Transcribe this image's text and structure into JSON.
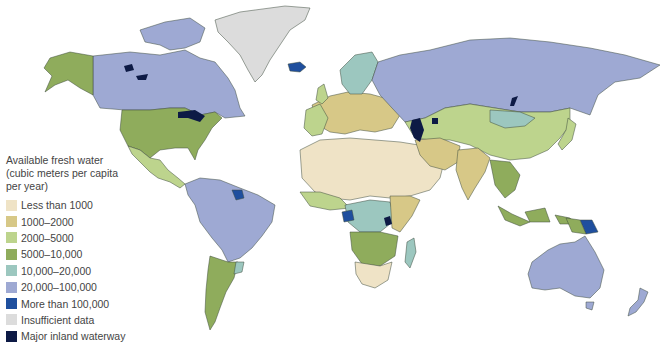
{
  "legend": {
    "title_lines": [
      "Available fresh water",
      "(cubic meters per capita",
      "per year)"
    ],
    "items": [
      {
        "label": "Less than 1000",
        "color": "#efe3c6"
      },
      {
        "label": "1000–2000",
        "color": "#d7c887"
      },
      {
        "label": "2000–5000",
        "color": "#bdd48d"
      },
      {
        "label": "5000–10,000",
        "color": "#8fac5c"
      },
      {
        "label": "10,000–20,000",
        "color": "#9cc7bf"
      },
      {
        "label": "20,000–100,000",
        "color": "#9ea9d3"
      },
      {
        "label": "More than 100,000",
        "color": "#1f4f9e"
      },
      {
        "label": "Insufficient data",
        "color": "#dcdcdc"
      },
      {
        "label": "Major inland waterway",
        "color": "#0d1a45"
      }
    ]
  },
  "map": {
    "type": "world choropleth",
    "metric": "Available fresh water per capita per year",
    "regions": [
      {
        "name": "Canada",
        "category": "20,000–100,000"
      },
      {
        "name": "Alaska",
        "category": "5000–10,000"
      },
      {
        "name": "United States",
        "category": "5000–10,000"
      },
      {
        "name": "Mexico",
        "category": "2000–5000"
      },
      {
        "name": "Greenland",
        "category": "Insufficient data"
      },
      {
        "name": "Iceland",
        "category": "More than 100,000"
      },
      {
        "name": "South America (north)",
        "category": "20,000–100,000"
      },
      {
        "name": "Guyana/Suriname",
        "category": "More than 100,000"
      },
      {
        "name": "Argentina",
        "category": "5000–10,000"
      },
      {
        "name": "Russia",
        "category": "20,000–100,000"
      },
      {
        "name": "Scandinavia",
        "category": "10,000–20,000"
      },
      {
        "name": "Mongolia",
        "category": "10,000–20,000"
      },
      {
        "name": "China/Central Asia",
        "category": "2000–5000"
      },
      {
        "name": "Europe",
        "category": "1000–2000"
      },
      {
        "name": "North Africa/Middle East",
        "category": "Less than 1000"
      },
      {
        "name": "India",
        "category": "1000–2000"
      },
      {
        "name": "Central Africa",
        "category": "10,000–20,000"
      },
      {
        "name": "Gabon/Congo",
        "category": "More than 100,000"
      },
      {
        "name": "Southern Africa",
        "category": "5000–10,000"
      },
      {
        "name": "Madagascar",
        "category": "10,000–20,000"
      },
      {
        "name": "Southeast Asia",
        "category": "5000–10,000"
      },
      {
        "name": "Papua New Guinea",
        "category": "More than 100,000"
      },
      {
        "name": "Australia",
        "category": "20,000–100,000"
      },
      {
        "name": "New Zealand",
        "category": "20,000–100,000"
      }
    ]
  }
}
